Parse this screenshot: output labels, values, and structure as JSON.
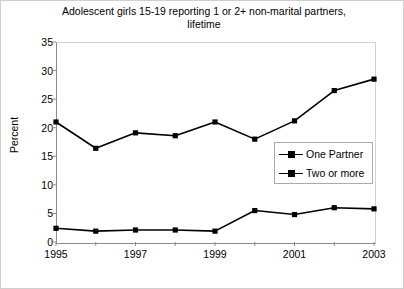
{
  "chart_data": {
    "type": "line",
    "title": "Adolescent girls 15-19 reporting 1 or 2+  non-marital partners, lifetime",
    "title_lines": [
      "Adolescent girls 15-19 reporting 1 or 2+  non-marital partners,",
      "lifetime"
    ],
    "xlabel": "",
    "ylabel": "Percent",
    "x": [
      1995,
      1996,
      1997,
      1998,
      1999,
      2000,
      2001,
      2002,
      2003
    ],
    "xlim": [
      1995,
      2003
    ],
    "ylim": [
      0,
      35
    ],
    "yticks": [
      0,
      5,
      10,
      15,
      20,
      25,
      30,
      35
    ],
    "ytick_labels": [
      "0",
      "5",
      "10",
      "15",
      "20",
      "25",
      "30",
      "35"
    ],
    "xticks": [
      1995,
      1996,
      1997,
      1998,
      1999,
      2000,
      2001,
      2002,
      2003
    ],
    "xtick_labels_shown": [
      "1995",
      "1997",
      "1999",
      "2001",
      "2003"
    ],
    "xtick_label_values": [
      1995,
      1997,
      1999,
      2001,
      2003
    ],
    "grid": false,
    "legend_position": "center-right",
    "series": [
      {
        "name": "One Partner",
        "marker": "square",
        "color": "#000000",
        "values": [
          21.0,
          16.4,
          19.1,
          18.6,
          21.0,
          18.0,
          21.2,
          26.5,
          28.5
        ]
      },
      {
        "name": "Two or more",
        "marker": "square",
        "color": "#000000",
        "values": [
          2.4,
          1.9,
          2.1,
          2.1,
          1.9,
          5.5,
          4.8,
          6.0,
          5.8
        ]
      }
    ]
  }
}
